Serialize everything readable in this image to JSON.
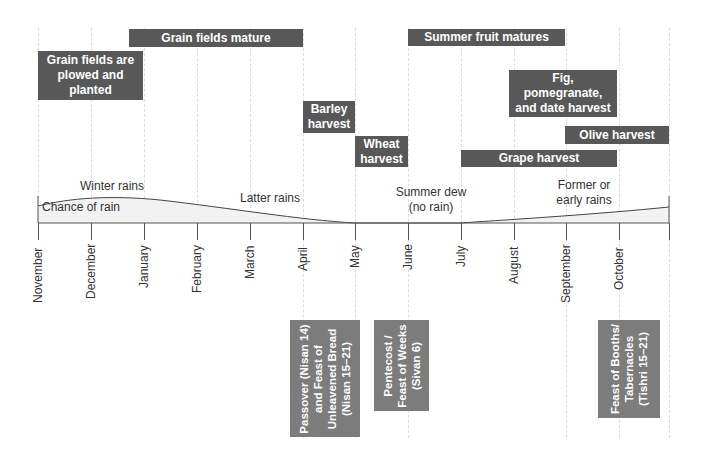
{
  "colors": {
    "bar_fill": "#585858",
    "festival_fill": "#7c7c7c",
    "rain_fill": "#f2f2f2",
    "axis": "#555555",
    "gridline": "#dcdcdc"
  },
  "months": [
    "November",
    "December",
    "January",
    "February",
    "March",
    "April",
    "May",
    "June",
    "July",
    "August",
    "September",
    "October",
    ""
  ],
  "rain": {
    "area_label": "Chance of rain",
    "seasons": [
      {
        "label": "Winter rains"
      },
      {
        "label": "Latter rains"
      },
      {
        "label": "Summer dew (no rain)"
      },
      {
        "label": "Former or early rains"
      }
    ]
  },
  "activities": [
    {
      "label": "Grain fields mature",
      "start": "Early January",
      "end": "April"
    },
    {
      "label": "Grain fields are plowed and planted",
      "start": "November",
      "end": "January"
    },
    {
      "label": "Barley harvest",
      "start": "April",
      "end": "May"
    },
    {
      "label": "Wheat harvest",
      "start": "May",
      "end": "June"
    },
    {
      "label": "Summer fruit matures",
      "start": "June",
      "end": "September"
    },
    {
      "label": "Fig, pomegranate, and date harvest",
      "start": "August",
      "end": "October"
    },
    {
      "label": "Olive harvest",
      "start": "September",
      "end": "End of October"
    },
    {
      "label": "Grape harvest",
      "start": "July",
      "end": "October"
    }
  ],
  "festivals": [
    {
      "label": "Passover (Nisan 14) and Feast of Unleavened Bread (Nisan 15–21)",
      "lines": [
        "Passover (Nisan 14)",
        "and Feast of",
        "Unleavened Bread",
        "(Nisan 15–21)"
      ]
    },
    {
      "label": "Pentecost / Feast of Weeks (Sivan 6)",
      "lines": [
        "Pentecost /",
        "Feast of Weeks",
        "(Sivan 6)"
      ]
    },
    {
      "label": "Feast of Booths/ Tabernacles (Tishri 15–21)",
      "lines": [
        "Feast of Booths/",
        "Tabernacles",
        "(Tishri 15–21)"
      ]
    }
  ]
}
